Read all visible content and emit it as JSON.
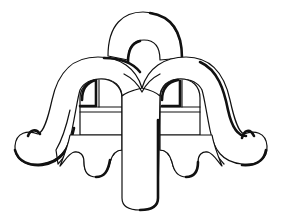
{
  "figure": {
    "ink_color": "#111111",
    "paper_color": "#ffffff"
  }
}
